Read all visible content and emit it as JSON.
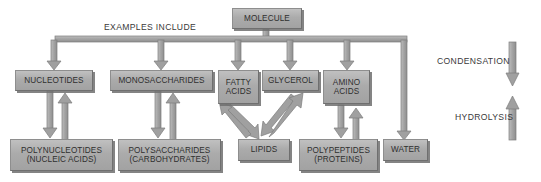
{
  "diagram": {
    "title_text": "EXAMPLES INCLUDE",
    "colors": {
      "box_fill": "#ababab",
      "box_border": "#8e8e8e",
      "box_shadow": "#6e6e6e",
      "arrow": "#9a9a9a",
      "arrow_stroke": "#7d7d7d",
      "text": "#2f2f2f",
      "background": "#ffffff"
    },
    "root": {
      "label": "MOLECULE"
    },
    "monomers": [
      {
        "label": "NUCLEOTIDES"
      },
      {
        "label": "MONOSACCHARIDES"
      },
      {
        "label_line1": "FATTY",
        "label_line2": "ACIDS"
      },
      {
        "label": "GLYCEROL"
      },
      {
        "label_line1": "AMINO",
        "label_line2": "ACIDS"
      }
    ],
    "polymers": [
      {
        "label_line1": "POLYNUCLEOTIDES",
        "label_line2": "(NUCLEIC ACIDS)"
      },
      {
        "label_line1": "POLYSACCHARIDES",
        "label_line2": "(CARBOHYDRATES)"
      },
      {
        "label": "LIPIDS"
      },
      {
        "label_line1": "POLYPEPTIDES",
        "label_line2": "(PROTEINS)"
      },
      {
        "label": "WATER"
      }
    ],
    "legend": {
      "condensation_label": "CONDENSATION",
      "hydrolysis_label": "HYDROLYSIS"
    }
  }
}
